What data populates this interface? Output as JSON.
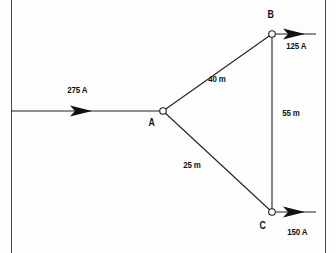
{
  "diagram": {
    "type": "electrical-network-schematic",
    "background_color": "#fdfdfd",
    "line_color": "#222222",
    "text_color": "#111111",
    "borders": [
      {
        "name": "left-page-border",
        "x": 11
      },
      {
        "name": "right-page-border",
        "x": 325
      }
    ],
    "nodes": [
      {
        "id": "A",
        "label": "A",
        "x": 163,
        "y": 111,
        "label_x": 148,
        "label_y": 118
      },
      {
        "id": "B",
        "label": "B",
        "x": 272,
        "y": 34,
        "label_x": 266,
        "label_y": 9
      },
      {
        "id": "C",
        "label": "C",
        "x": 272,
        "y": 212,
        "label_x": 259,
        "label_y": 221
      }
    ],
    "branches": [
      {
        "name": "branch-A-B",
        "from": "A",
        "to": "B",
        "length_label": "40 m",
        "label_x": 208,
        "label_y": 74
      },
      {
        "name": "branch-A-C",
        "from": "A",
        "to": "C",
        "length_label": "25 m",
        "label_x": 183,
        "label_y": 160
      },
      {
        "name": "branch-B-C",
        "from": "B",
        "to": "C",
        "length_label": "55 m",
        "label_x": 281,
        "label_y": 108
      }
    ],
    "currents": [
      {
        "name": "supply-current-A",
        "label": "275 A",
        "direction": "right",
        "label_x": 68,
        "label_y": 85,
        "line_from_x": 11,
        "line_to_x": 163,
        "line_y": 111,
        "arrow_x": 72
      },
      {
        "name": "load-current-B",
        "label": "125 A",
        "direction": "right",
        "label_x": 286,
        "label_y": 42,
        "line_from_x": 272,
        "line_to_x": 316,
        "line_y": 34,
        "arrow_x": 288
      },
      {
        "name": "load-current-C",
        "label": "150 A",
        "direction": "right",
        "label_x": 288,
        "label_y": 228,
        "line_from_x": 272,
        "line_to_x": 316,
        "line_y": 212,
        "arrow_x": 288
      }
    ]
  }
}
